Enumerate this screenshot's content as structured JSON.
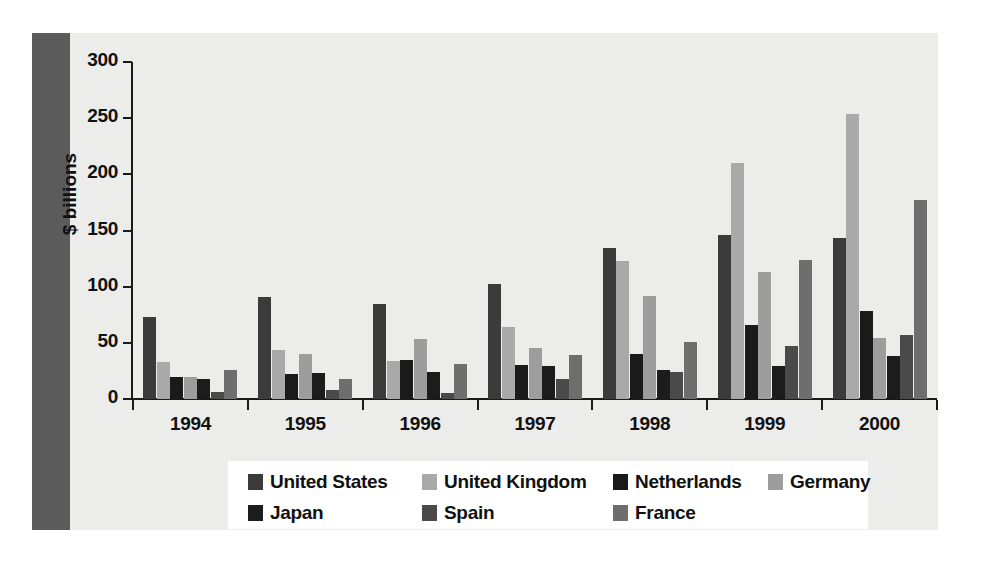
{
  "figure": {
    "background_color": "#ececeb",
    "left_band_color": "#5b5b5b"
  },
  "chart_data": {
    "type": "bar",
    "title": "",
    "xlabel": "",
    "ylabel": "$ billions",
    "ylim": [
      0,
      300
    ],
    "yticks": [
      0,
      50,
      100,
      150,
      200,
      250,
      300
    ],
    "ytick_labels": [
      "0",
      "50",
      "100",
      "150",
      "200",
      "250",
      "300"
    ],
    "grid": false,
    "legend_position": "bottom",
    "categories": [
      "1994",
      "1995",
      "1996",
      "1997",
      "1998",
      "1999",
      "2000"
    ],
    "series": [
      {
        "name": "United States",
        "color": "#3b3b3b",
        "values": [
          73,
          91,
          85,
          102,
          134,
          146,
          143
        ]
      },
      {
        "name": "United Kingdom",
        "color": "#a9a9a9",
        "values": [
          33,
          44,
          34,
          64,
          123,
          210,
          254
        ]
      },
      {
        "name": "Netherlands",
        "color": "#1a1a1a",
        "values": [
          20,
          22,
          35,
          30,
          40,
          66,
          78
        ]
      },
      {
        "name": "Germany",
        "color": "#9d9d9d",
        "values": [
          20,
          40,
          53,
          45,
          92,
          113,
          54
        ]
      },
      {
        "name": "Japan",
        "color": "#1c1c1c",
        "values": [
          18,
          23,
          24,
          29,
          26,
          29,
          38
        ]
      },
      {
        "name": "Spain",
        "color": "#4a4a4a",
        "values": [
          6,
          8,
          5,
          18,
          24,
          47,
          57
        ]
      },
      {
        "name": "France",
        "color": "#6e6e6e",
        "values": [
          26,
          18,
          31,
          39,
          51,
          124,
          177
        ]
      }
    ]
  },
  "legend": {
    "rows": [
      [
        {
          "label": "United States",
          "color": "#3b3b3b",
          "x": 20,
          "swatch": "legend-swatch"
        },
        {
          "label": "United Kingdom",
          "color": "#a9a9a9",
          "x": 194,
          "swatch": "legend-swatch"
        },
        {
          "label": "Netherlands",
          "color": "#1a1a1a",
          "x": 385,
          "swatch": "legend-swatch"
        },
        {
          "label": "Germany",
          "color": "#9d9d9d",
          "x": 540,
          "swatch": "legend-swatch"
        }
      ],
      [
        {
          "label": "Japan",
          "color": "#1c1c1c",
          "x": 20,
          "swatch": "legend-swatch"
        },
        {
          "label": "Spain",
          "color": "#4a4a4a",
          "x": 194,
          "swatch": "legend-swatch"
        },
        {
          "label": "France",
          "color": "#6e6e6e",
          "x": 385,
          "swatch": "legend-swatch"
        }
      ]
    ]
  }
}
